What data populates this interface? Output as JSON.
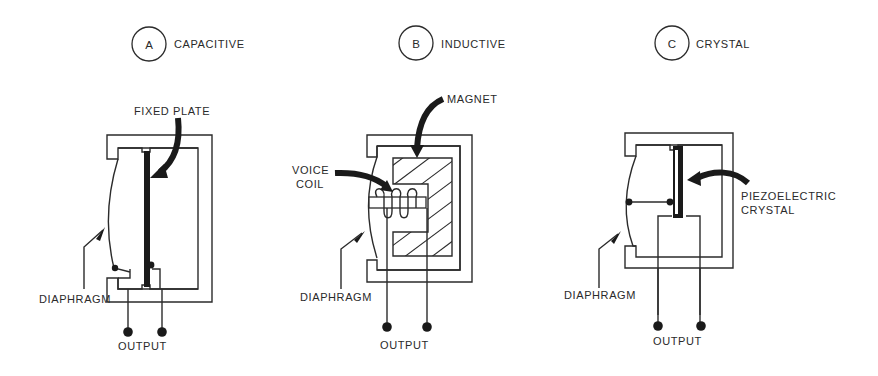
{
  "diagram": {
    "type": "microphone-types",
    "panels": [
      {
        "letter": "A",
        "title": "CAPACITIVE",
        "labels": {
          "fixed_plate": "FIXED PLATE",
          "diaphragm": "DIAPHRAGM",
          "output": "OUTPUT"
        }
      },
      {
        "letter": "B",
        "title": "INDUCTIVE",
        "labels": {
          "magnet": "MAGNET",
          "voice_coil_line1": "VOICE",
          "voice_coil_line2": "COIL",
          "diaphragm": "DIAPHRAGM",
          "output": "OUTPUT"
        }
      },
      {
        "letter": "C",
        "title": "CRYSTAL",
        "labels": {
          "crystal_line1": "PIEZOELECTRIC",
          "crystal_line2": "CRYSTAL",
          "diaphragm": "DIAPHRAGM",
          "output": "OUTPUT"
        }
      }
    ],
    "colors": {
      "ink": "#2b2b2b",
      "background": "#ffffff"
    }
  }
}
